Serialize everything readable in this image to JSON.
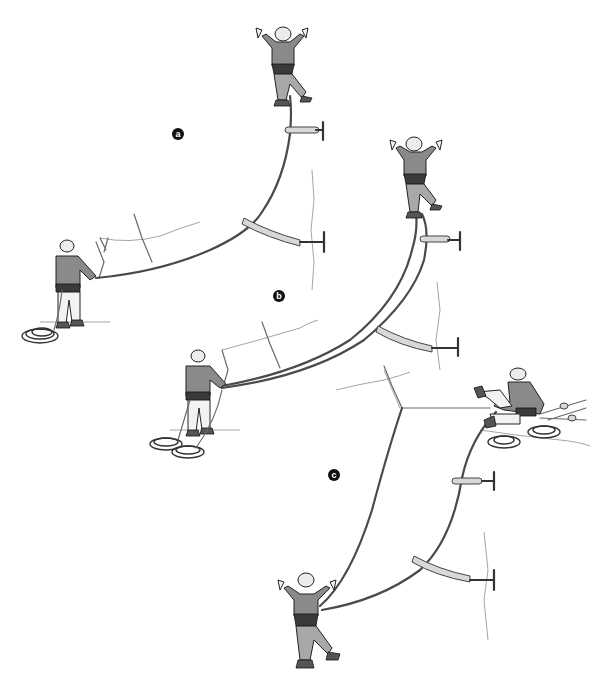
{
  "figure": {
    "type": "instructional-illustration",
    "background_color": "#ffffff",
    "ink_color": "#222222",
    "panels": [
      {
        "label": "a",
        "description": "Leader climbing above two protection points; belayer standing at a two-bolt anchor below-left with rope coiled at feet",
        "label_position": {
          "x": 178,
          "y": 134
        }
      },
      {
        "label": "b",
        "description": "Leader climbing on twin/double ropes clipped alternately to protection; belayer at anchor with two rope piles",
        "label_position": {
          "x": 279,
          "y": 296
        }
      },
      {
        "label": "c",
        "description": "Belayer seated at top anchor bringing up a second climber who is following on double ropes past two protection points",
        "label_position": {
          "x": 334,
          "y": 475
        }
      }
    ]
  }
}
